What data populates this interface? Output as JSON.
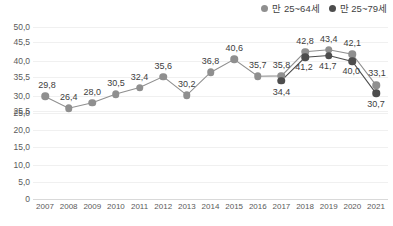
{
  "chart_data": {
    "type": "line",
    "title": "",
    "xlabel": "",
    "ylabel": "",
    "grid": true,
    "legend_position": "top-right",
    "ylim": [
      0,
      50
    ],
    "yticks": [
      "50,0",
      "45,5",
      "40,0",
      "35,5",
      "30,0",
      "25,5",
      "25,0",
      "20,0",
      "15,0",
      "10,0",
      "5,0",
      "0"
    ],
    "ytick_values": [
      50.0,
      45.5,
      40.0,
      35.5,
      30.0,
      25.5,
      25.0,
      20.0,
      15.0,
      10.0,
      5.0,
      0
    ],
    "categories": [
      "2007",
      "2008",
      "2009",
      "2010",
      "2011",
      "2012",
      "2013",
      "2014",
      "2015",
      "2016",
      "2017",
      "2018",
      "2019",
      "2020",
      "2021"
    ],
    "series": [
      {
        "name": "만 25~64세",
        "color": "#8f8f8f",
        "values": [
          29.8,
          26.4,
          28.0,
          30.5,
          32.4,
          35.6,
          30.2,
          36.8,
          40.6,
          35.7,
          35.8,
          42.8,
          43.4,
          42.1,
          33.1
        ],
        "labels": [
          "29,8",
          "26,4",
          "28,0",
          "30,5",
          "32,4",
          "35,6",
          "30,2",
          "36,8",
          "40,6",
          "35,7",
          "35,8",
          "42,8",
          "43,4",
          "42,1",
          "33,1"
        ]
      },
      {
        "name": "만 25~79세",
        "color": "#4d4d4d",
        "values": [
          null,
          null,
          null,
          null,
          null,
          null,
          null,
          null,
          null,
          null,
          34.4,
          41.2,
          41.7,
          40.0,
          30.7
        ],
        "labels": [
          null,
          null,
          null,
          null,
          null,
          null,
          null,
          null,
          null,
          null,
          "34,4",
          "41,2",
          "41,7",
          "40,0",
          "30,7"
        ]
      }
    ]
  },
  "legend": {
    "entries": [
      {
        "label": "만 25~64세",
        "marker": "circle-marker-light"
      },
      {
        "label": "만 25~79세",
        "marker": "circle-marker-dark"
      }
    ]
  },
  "colors": {
    "series_light": "#8f8f8f",
    "series_dark": "#4d4d4d",
    "gridline": "#f0f0f0",
    "axis": "#d9d9d9",
    "text": "#555555",
    "background": "#ffffff"
  }
}
